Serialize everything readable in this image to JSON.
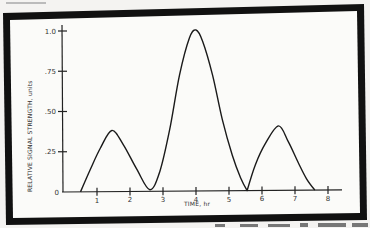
{
  "chart_data": {
    "type": "line",
    "title": "",
    "xlabel": "TIME, hr",
    "ylabel": "RELATIVE SIGNAL STRENGTH, units",
    "xlim": [
      0,
      8.4
    ],
    "ylim": [
      0,
      1.0
    ],
    "x_ticks": [
      1,
      2,
      3,
      4,
      5,
      6,
      7,
      8
    ],
    "x_tick_labels": [
      "1",
      "2",
      "3",
      "4",
      "5",
      "6",
      "7",
      "8"
    ],
    "y_ticks": [
      0,
      0.25,
      0.5,
      0.75,
      1.0
    ],
    "y_tick_labels": [
      "0",
      ".25",
      ".50",
      ".75",
      "1.0"
    ],
    "grid": false,
    "legend": null,
    "series": [
      {
        "name": "Relative signal strength",
        "x": [
          0.5,
          0.8,
          1.1,
          1.45,
          1.8,
          2.2,
          2.6,
          2.9,
          3.2,
          3.5,
          3.8,
          4.0,
          4.2,
          4.5,
          4.8,
          5.1,
          5.35,
          5.55,
          5.8,
          6.1,
          6.5,
          6.8,
          7.1,
          7.35,
          7.6
        ],
        "y": [
          0.0,
          0.14,
          0.27,
          0.38,
          0.29,
          0.14,
          0.01,
          0.12,
          0.38,
          0.72,
          0.95,
          1.0,
          0.93,
          0.72,
          0.44,
          0.22,
          0.08,
          0.0,
          0.16,
          0.29,
          0.4,
          0.3,
          0.17,
          0.07,
          0.0
        ]
      }
    ],
    "annotations": []
  }
}
